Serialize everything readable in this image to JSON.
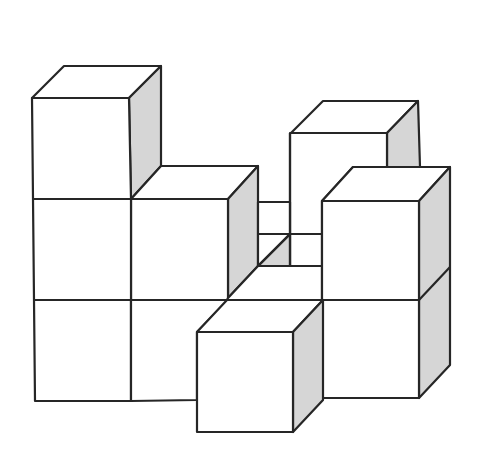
{
  "diagram": {
    "title": "",
    "colors": {
      "background": "#ffffff",
      "front_face": "#ffffff",
      "top_face": "#ffffff",
      "side_face": "#d6d6d6",
      "edge": "#262626"
    },
    "stroke_width": 2.2,
    "faces": [
      {
        "id": "tl-top",
        "fill": "top",
        "points": "32,98 64,66 161,66 129,98"
      },
      {
        "id": "tl-side",
        "fill": "side",
        "points": "129,98 161,66 161,166 131,199"
      },
      {
        "id": "tl-front",
        "fill": "front",
        "points": "32,98 129,98 131,199 33,199"
      },
      {
        "id": "mid-top",
        "fill": "top",
        "points": "131,199 161,166 258,166 228,199"
      },
      {
        "id": "mid-side",
        "fill": "side",
        "points": "228,199 258,166 258,266 228,298"
      },
      {
        "id": "mid-front",
        "fill": "front",
        "points": "131,199 228,199 228,300 131,300"
      },
      {
        "id": "l-row2-front",
        "fill": "front",
        "points": "33,199 131,199 131,300 34,300"
      },
      {
        "id": "l-row3-front",
        "fill": "front",
        "points": "34,300 131,300 131,401 35,401"
      },
      {
        "id": "m-row3-front",
        "fill": "front",
        "points": "131,300 228,300 197,332 197,400 131,401"
      },
      {
        "id": "bu-top",
        "fill": "top",
        "points": "291,133 323,101 418,101 387,133"
      },
      {
        "id": "bu-side",
        "fill": "side",
        "points": "387,133 418,101 420,167 387,167"
      },
      {
        "id": "bu-front",
        "fill": "front",
        "points": "290,133 387,133 387,167 353,167 322,201 322,234 290,234"
      },
      {
        "id": "back-gap-top",
        "fill": "front",
        "points": "258,202 290,202 290,234 258,234"
      },
      {
        "id": "back-gap-low",
        "fill": "front",
        "points": "290,234 322,234 322,266 290,266"
      },
      {
        "id": "back-tri-side",
        "fill": "side",
        "points": "290,234 290,266 258,266"
      },
      {
        "id": "back-tri-front",
        "fill": "front",
        "points": "258,234 290,234 258,266"
      },
      {
        "id": "floor-top",
        "fill": "top",
        "points": "258,266 322,266 322,300 227,300 228,298"
      },
      {
        "id": "rs-top",
        "fill": "top",
        "points": "322,201 353,167 450,167 419,201"
      },
      {
        "id": "rs-side",
        "fill": "side",
        "points": "419,201 450,167 450,365 419,398"
      },
      {
        "id": "rs-front-up",
        "fill": "front",
        "points": "322,201 419,201 419,300 322,300"
      },
      {
        "id": "rs-front-low",
        "fill": "front",
        "points": "322,300 419,300 419,398 322,398"
      },
      {
        "id": "fb-top",
        "fill": "top",
        "points": "197,332 227,300 323,300 293,332"
      },
      {
        "id": "fb-side",
        "fill": "side",
        "points": "293,332 323,300 323,400 293,432"
      },
      {
        "id": "fb-front",
        "fill": "front",
        "points": "197,332 293,332 293,432 197,432"
      }
    ],
    "extra_lines": [
      {
        "id": "rs-side-mid",
        "points": "419,300 450,267"
      },
      {
        "id": "diag-back",
        "points": "290,234 258,266"
      },
      {
        "id": "bu-left-down",
        "points": "290,133 290,266"
      }
    ],
    "cube_count_visible": 11
  }
}
